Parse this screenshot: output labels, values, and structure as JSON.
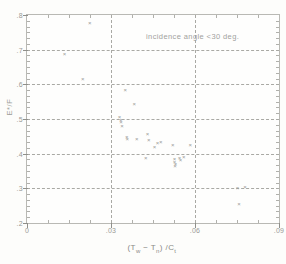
{
  "chart_data": {
    "type": "scatter",
    "title": "",
    "subtitle": "",
    "xlabel": "(Tw − Tn) /Ct",
    "ylabel": "E*/F",
    "xlim": [
      0,
      0.09
    ],
    "ylim": [
      0.2,
      0.8
    ],
    "grid": true,
    "legend": null,
    "legend_position": "none",
    "annotations": [
      {
        "text": "incidence angle <30 deg.",
        "x": 0.0425,
        "y": 0.752
      }
    ],
    "xticks": [
      0,
      0.03,
      0.06,
      0.09
    ],
    "xtick_labels": [
      "0",
      ".03",
      ".06",
      ".09"
    ],
    "yticks": [
      0.2,
      0.3,
      0.4,
      0.5,
      0.6,
      0.7,
      0.8
    ],
    "ytick_labels": [
      ".2",
      ".3",
      ".4",
      ".5",
      ".6",
      ".7",
      ".8"
    ],
    "xminor_count": 3,
    "yminor_count": 5,
    "marker": "x",
    "marker_color": "#9b9b97",
    "series": [
      {
        "name": "incidence angle <30 deg.",
        "points": [
          [
            0.0224,
            0.777
          ],
          [
            0.0134,
            0.688
          ],
          [
            0.0199,
            0.616
          ],
          [
            0.0351,
            0.584
          ],
          [
            0.0383,
            0.544
          ],
          [
            0.033,
            0.5045
          ],
          [
            0.0335,
            0.4985
          ],
          [
            0.0336,
            0.49
          ],
          [
            0.0339,
            0.481
          ],
          [
            0.043,
            0.456
          ],
          [
            0.0356,
            0.448
          ],
          [
            0.0358,
            0.443
          ],
          [
            0.0392,
            0.4425
          ],
          [
            0.0435,
            0.44
          ],
          [
            0.0466,
            0.431
          ],
          [
            0.0478,
            0.434
          ],
          [
            0.0521,
            0.425
          ],
          [
            0.0455,
            0.4205
          ],
          [
            0.0583,
            0.425
          ],
          [
            0.0424,
            0.388
          ],
          [
            0.0527,
            0.3855
          ],
          [
            0.0545,
            0.3865
          ],
          [
            0.056,
            0.3905
          ],
          [
            0.0548,
            0.3805
          ],
          [
            0.0527,
            0.3755
          ],
          [
            0.053,
            0.37
          ],
          [
            0.0529,
            0.364
          ],
          [
            0.0752,
            0.301
          ],
          [
            0.0779,
            0.303
          ],
          [
            0.0757,
            0.256
          ]
        ]
      }
    ]
  }
}
